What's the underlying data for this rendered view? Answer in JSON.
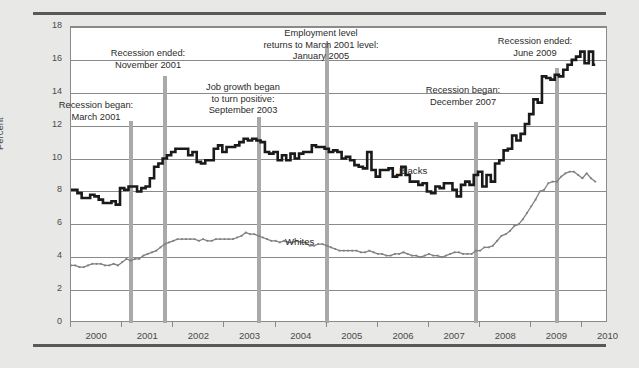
{
  "chart_data": {
    "type": "line",
    "title": "",
    "xlabel": "",
    "ylabel": "Percent",
    "ylim": [
      0,
      18
    ],
    "xlim": [
      2000.0,
      2010.5
    ],
    "yticks": [
      0,
      2,
      4,
      6,
      8,
      10,
      12,
      14,
      16,
      18
    ],
    "xticks": [
      2000,
      2001,
      2002,
      2003,
      2004,
      2005,
      2006,
      2007,
      2008,
      2009,
      2010
    ],
    "grid": "horizontal",
    "legend_position": "inline-labels",
    "series": [
      {
        "name": "Blacks",
        "color": "#1a1a1a",
        "style": "thick-step",
        "x": [
          2000.0,
          2000.083,
          2000.167,
          2000.25,
          2000.333,
          2000.417,
          2000.5,
          2000.583,
          2000.667,
          2000.75,
          2000.833,
          2000.917,
          2001.0,
          2001.083,
          2001.167,
          2001.25,
          2001.333,
          2001.417,
          2001.5,
          2001.583,
          2001.667,
          2001.75,
          2001.833,
          2001.917,
          2002.0,
          2002.083,
          2002.167,
          2002.25,
          2002.333,
          2002.417,
          2002.5,
          2002.583,
          2002.667,
          2002.75,
          2002.833,
          2002.917,
          2003.0,
          2003.083,
          2003.167,
          2003.25,
          2003.333,
          2003.417,
          2003.5,
          2003.583,
          2003.667,
          2003.75,
          2003.833,
          2003.917,
          2004.0,
          2004.083,
          2004.167,
          2004.25,
          2004.333,
          2004.417,
          2004.5,
          2004.583,
          2004.667,
          2004.75,
          2004.833,
          2004.917,
          2005.0,
          2005.083,
          2005.167,
          2005.25,
          2005.333,
          2005.417,
          2005.5,
          2005.583,
          2005.667,
          2005.75,
          2005.833,
          2005.917,
          2006.0,
          2006.083,
          2006.167,
          2006.25,
          2006.333,
          2006.417,
          2006.5,
          2006.583,
          2006.667,
          2006.75,
          2006.833,
          2006.917,
          2007.0,
          2007.083,
          2007.167,
          2007.25,
          2007.333,
          2007.417,
          2007.5,
          2007.583,
          2007.667,
          2007.75,
          2007.833,
          2007.917,
          2008.0,
          2008.083,
          2008.167,
          2008.25,
          2008.333,
          2008.417,
          2008.5,
          2008.583,
          2008.667,
          2008.75,
          2008.833,
          2008.917,
          2009.0,
          2009.083,
          2009.167,
          2009.25,
          2009.333,
          2009.417,
          2009.5,
          2009.583,
          2009.667,
          2009.75,
          2009.833,
          2009.917,
          2010.0,
          2010.083,
          2010.167,
          2010.25
        ],
        "values": [
          8.1,
          8.1,
          7.9,
          7.6,
          7.6,
          7.8,
          7.7,
          7.5,
          7.3,
          7.3,
          7.4,
          7.2,
          8.2,
          8.1,
          8.3,
          8.3,
          8.0,
          8.2,
          8.3,
          8.8,
          9.5,
          9.7,
          10.0,
          10.2,
          10.4,
          10.6,
          10.6,
          10.6,
          10.2,
          10.4,
          9.8,
          9.7,
          9.9,
          9.9,
          10.6,
          10.8,
          10.4,
          10.7,
          10.7,
          10.8,
          11.0,
          11.2,
          11.1,
          11.2,
          11.1,
          11.0,
          10.4,
          10.3,
          10.4,
          9.9,
          10.2,
          9.9,
          10.3,
          10.0,
          10.3,
          10.4,
          10.4,
          10.8,
          10.7,
          10.7,
          10.6,
          10.4,
          10.5,
          10.4,
          10.0,
          10.1,
          9.9,
          9.6,
          9.5,
          9.4,
          10.4,
          9.3,
          8.9,
          9.3,
          9.3,
          9.4,
          8.9,
          9.0,
          9.5,
          9.0,
          8.6,
          8.6,
          8.4,
          8.5,
          8.0,
          7.9,
          8.3,
          8.2,
          8.5,
          8.5,
          8.1,
          7.7,
          8.4,
          8.6,
          8.4,
          9.0,
          9.2,
          8.3,
          9.0,
          8.6,
          9.7,
          9.9,
          10.5,
          10.6,
          11.4,
          11.1,
          11.5,
          12.1,
          12.7,
          13.6,
          13.4,
          15.0,
          14.9,
          14.8,
          15.1,
          15.0,
          15.4,
          15.7,
          16.0,
          16.2,
          16.5,
          15.8,
          16.5,
          15.7
        ]
      },
      {
        "name": "Whites",
        "color": "#808080",
        "style": "thin-dotted",
        "x": [
          2000.0,
          2000.083,
          2000.167,
          2000.25,
          2000.333,
          2000.417,
          2000.5,
          2000.583,
          2000.667,
          2000.75,
          2000.833,
          2000.917,
          2001.0,
          2001.083,
          2001.167,
          2001.25,
          2001.333,
          2001.417,
          2001.5,
          2001.583,
          2001.667,
          2001.75,
          2001.833,
          2001.917,
          2002.0,
          2002.083,
          2002.167,
          2002.25,
          2002.333,
          2002.417,
          2002.5,
          2002.583,
          2002.667,
          2002.75,
          2002.833,
          2002.917,
          2003.0,
          2003.083,
          2003.167,
          2003.25,
          2003.333,
          2003.417,
          2003.5,
          2003.583,
          2003.667,
          2003.75,
          2003.833,
          2003.917,
          2004.0,
          2004.083,
          2004.167,
          2004.25,
          2004.333,
          2004.417,
          2004.5,
          2004.583,
          2004.667,
          2004.75,
          2004.833,
          2004.917,
          2005.0,
          2005.083,
          2005.167,
          2005.25,
          2005.333,
          2005.417,
          2005.5,
          2005.583,
          2005.667,
          2005.75,
          2005.833,
          2005.917,
          2006.0,
          2006.083,
          2006.167,
          2006.25,
          2006.333,
          2006.417,
          2006.5,
          2006.583,
          2006.667,
          2006.75,
          2006.833,
          2006.917,
          2007.0,
          2007.083,
          2007.167,
          2007.25,
          2007.333,
          2007.417,
          2007.5,
          2007.583,
          2007.667,
          2007.75,
          2007.833,
          2007.917,
          2008.0,
          2008.083,
          2008.167,
          2008.25,
          2008.333,
          2008.417,
          2008.5,
          2008.583,
          2008.667,
          2008.75,
          2008.833,
          2008.917,
          2009.0,
          2009.083,
          2009.167,
          2009.25,
          2009.333,
          2009.417,
          2009.5,
          2009.583,
          2009.667,
          2009.75,
          2009.833,
          2009.917,
          2010.0,
          2010.083,
          2010.167,
          2010.25
        ],
        "values": [
          3.5,
          3.5,
          3.4,
          3.4,
          3.5,
          3.6,
          3.6,
          3.6,
          3.5,
          3.5,
          3.6,
          3.5,
          3.7,
          3.9,
          3.8,
          3.9,
          3.9,
          4.1,
          4.2,
          4.3,
          4.4,
          4.6,
          4.8,
          4.9,
          5.0,
          5.1,
          5.1,
          5.1,
          5.1,
          5.1,
          5.0,
          5.1,
          5.0,
          5.0,
          5.1,
          5.1,
          5.1,
          5.1,
          5.1,
          5.2,
          5.3,
          5.5,
          5.4,
          5.4,
          5.3,
          5.2,
          5.1,
          5.0,
          5.0,
          4.9,
          5.0,
          4.9,
          4.9,
          5.0,
          4.9,
          4.9,
          4.7,
          4.7,
          4.8,
          4.8,
          4.7,
          4.6,
          4.5,
          4.4,
          4.4,
          4.4,
          4.4,
          4.4,
          4.3,
          4.3,
          4.4,
          4.3,
          4.2,
          4.2,
          4.1,
          4.1,
          4.2,
          4.2,
          4.3,
          4.2,
          4.1,
          4.1,
          4.0,
          4.1,
          4.2,
          4.1,
          4.1,
          4.0,
          4.1,
          4.2,
          4.3,
          4.3,
          4.2,
          4.2,
          4.2,
          4.4,
          4.4,
          4.6,
          4.6,
          4.7,
          5.0,
          5.3,
          5.4,
          5.6,
          5.9,
          6.0,
          6.3,
          6.7,
          7.1,
          7.5,
          8.0,
          8.1,
          8.5,
          8.6,
          8.6,
          8.9,
          9.1,
          9.2,
          9.2,
          9.0,
          8.8,
          9.1,
          8.8,
          8.6
        ]
      }
    ],
    "annotations": [
      {
        "id": "recession-began-2001",
        "label_line1": "Recession began:",
        "label_line2": "March 2001",
        "x_year": 2001.17,
        "marker_top_value": 12.3
      },
      {
        "id": "recession-ended-2001",
        "label_line1": "Recession ended:",
        "label_line2": "November 2001",
        "x_year": 2001.83,
        "marker_top_value": 15.0
      },
      {
        "id": "job-growth-positive-2003",
        "label_line1": "Job growth began",
        "label_line2": "to turn positive:",
        "label_line3": "September 2003",
        "x_year": 2003.67,
        "marker_top_value": 12.5
      },
      {
        "id": "employment-returns-2005",
        "label_line1": "Employment level",
        "label_line2": "returns to March 2001 level:",
        "label_line3": "January 2005",
        "x_year": 2005.0,
        "marker_top_value": 17.0
      },
      {
        "id": "recession-began-2007",
        "label_line1": "Recession began:",
        "label_line2": "December 2007",
        "x_year": 2007.92,
        "marker_top_value": 12.2
      },
      {
        "id": "recession-ended-2009",
        "label_line1": "Recession ended:",
        "label_line2": "June 2009",
        "x_year": 2009.5,
        "marker_top_value": 15.5
      }
    ]
  },
  "axis": {
    "y_title": "Percent",
    "y_tick_labels": [
      "18",
      "16",
      "14",
      "12",
      "10",
      "8",
      "6",
      "4",
      "2",
      "0"
    ],
    "x_tick_labels": [
      "2000",
      "2001",
      "2002",
      "2003",
      "2004",
      "2005",
      "2006",
      "2007",
      "2008",
      "2009",
      "2010"
    ]
  },
  "series_labels": {
    "blacks": "Blacks",
    "whites": "Whites"
  },
  "annotation_text": {
    "a1_l1": "Recession began:",
    "a1_l2": "March 2001",
    "a2_l1": "Recession ended:",
    "a2_l2": "November 2001",
    "a3_l1": "Job growth began",
    "a3_l2": "to turn positive:",
    "a3_l3": "September 2003",
    "a4_l1": "Employment level",
    "a4_l2": "returns to March 2001 level:",
    "a4_l3": "January 2005",
    "a5_l1": "Recession began:",
    "a5_l2": "December 2007",
    "a6_l1": "Recession ended:",
    "a6_l2": "June 2009"
  },
  "colors": {
    "figure_background": "#e8e8e6",
    "plot_background": "#ffffff",
    "grid": "#8a8a8a",
    "rule": "#58585a",
    "blacks_line": "#1a1a1a",
    "whites_line": "#808080",
    "marker": "#a9a9a9",
    "text": "#2b2b2b"
  }
}
